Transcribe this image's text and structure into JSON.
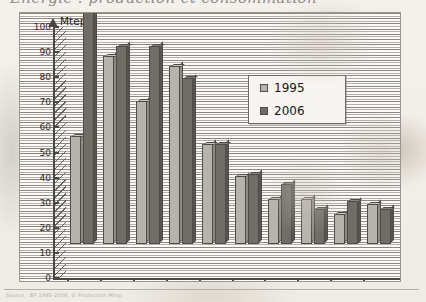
{
  "header": {
    "cropped_title_fragment": "Énergie : production et consommation"
  },
  "footer": {
    "source_note": "Source : BP 1995-2006, © Production Mtep"
  },
  "axis": {
    "y_unit_label": "Mtep",
    "y_ticks": [
      0,
      10,
      20,
      30,
      40,
      50,
      60,
      70,
      80,
      90,
      100
    ]
  },
  "legend": {
    "items": [
      {
        "label": "1995",
        "color": "#b6b3ad"
      },
      {
        "label": "2006",
        "color": "#706d68"
      }
    ]
  },
  "chart_data": {
    "type": "bar",
    "title": "Mtep",
    "xlabel": "",
    "ylabel": "Mtep",
    "ylim": [
      0,
      100
    ],
    "grid": true,
    "legend_position": "inside-top-right",
    "categories": [
      "Chine",
      "Canada",
      "Brésil",
      "USA",
      "Russie",
      "Norvège",
      "Inde",
      "France",
      "Venez.",
      "Suède"
    ],
    "series": [
      {
        "name": "1995",
        "color": "#b6b3ad",
        "values": [
          43,
          75,
          57,
          71,
          40,
          27,
          18,
          18,
          12,
          16
        ]
      },
      {
        "name": "2006",
        "color": "#706d68",
        "values": [
          95,
          79,
          79,
          66,
          40,
          28,
          24,
          14,
          17,
          14
        ]
      }
    ]
  }
}
